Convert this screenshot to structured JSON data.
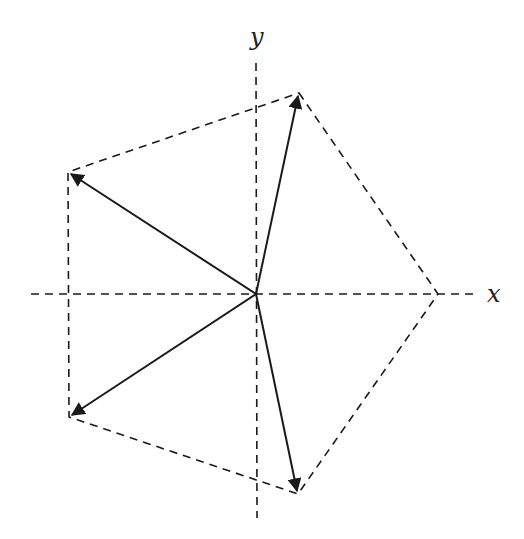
{
  "diagram": {
    "colors": {
      "stroke": "#1a1a1a",
      "dashed": "#1a1a1a",
      "label": "#222222",
      "background": "#ffffff"
    },
    "axes": {
      "x_label": "x",
      "y_label": "y",
      "origin": [
        256,
        294
      ]
    },
    "vertices": [
      {
        "name": "top",
        "point": [
          299,
          93
        ]
      },
      {
        "name": "upper-left",
        "point": [
          68,
          172
        ]
      },
      {
        "name": "lower-left",
        "point": [
          69,
          417
        ]
      },
      {
        "name": "bottom",
        "point": [
          298,
          494
        ]
      },
      {
        "name": "right",
        "point": [
          438,
          294
        ]
      }
    ],
    "vectors": [
      {
        "name": "vector-top",
        "to": "top",
        "arrowhead": true
      },
      {
        "name": "vector-upper-left",
        "to": "upper-left",
        "arrowhead": true
      },
      {
        "name": "vector-lower-left",
        "to": "lower-left",
        "arrowhead": true
      },
      {
        "name": "vector-bottom",
        "to": "bottom",
        "arrowhead": true
      }
    ],
    "pentagon_edges": "dashed"
  }
}
